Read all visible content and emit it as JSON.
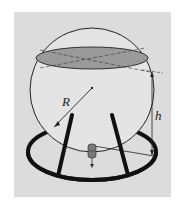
{
  "diagram": {
    "labels": {
      "radius": "R",
      "height": "h"
    },
    "colors": {
      "background": "#dcdcdc",
      "sphere_fill": "#e4e4e4",
      "liquid_surface": "#9a9a9a",
      "stroke": "#1a1a1a",
      "valve": "#7a7a7a"
    },
    "components": [
      "sphere",
      "liquid-surface-ellipse",
      "radius-line",
      "height-dimension",
      "stand-ring",
      "legs",
      "drain-valve"
    ]
  }
}
